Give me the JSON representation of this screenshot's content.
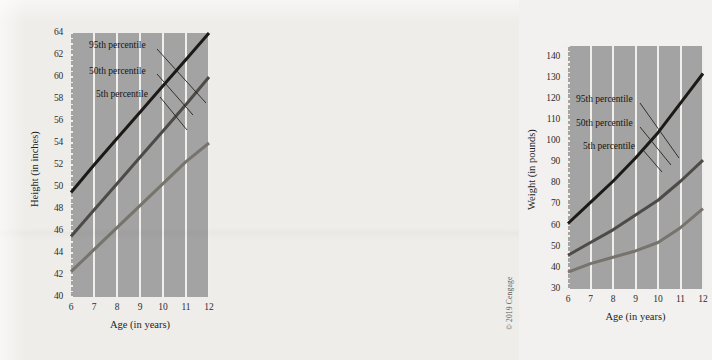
{
  "page": {
    "background_color": "#eeedea",
    "copyright": "© 2019 Cengage"
  },
  "series_style": {
    "p95_color": "#1c1a17",
    "p50_color": "#4d4b47",
    "p5_color": "#77746e",
    "plot_background": "#a3a3a3",
    "gridline_color": "#f0efec"
  },
  "legend": {
    "p95": "95th percentile",
    "p50": "50th percentile",
    "p5": "5th percentile"
  },
  "chart_data": [
    {
      "id": "height-chart",
      "type": "line",
      "title": "",
      "xlabel": "Age (in years)",
      "ylabel": "Height (in inches)",
      "xlim": [
        6,
        12
      ],
      "ylim": [
        40,
        64
      ],
      "xticks": [
        6,
        7,
        8,
        9,
        10,
        11,
        12
      ],
      "yticks": [
        40,
        42,
        44,
        46,
        48,
        50,
        52,
        54,
        56,
        58,
        60,
        62,
        64
      ],
      "ytick_minor_step": 0.5,
      "grid": "vertical",
      "legend_position": "inside-top-left",
      "x": [
        6,
        7,
        8,
        9,
        10,
        11,
        12
      ],
      "series": [
        {
          "name": "95th percentile",
          "values": [
            49.5,
            52.0,
            54.4,
            56.8,
            59.2,
            61.6,
            64.0
          ]
        },
        {
          "name": "50th percentile",
          "values": [
            45.5,
            47.9,
            50.3,
            52.7,
            55.1,
            57.5,
            60.0
          ]
        },
        {
          "name": "5th percentile",
          "values": [
            42.3,
            44.3,
            46.3,
            48.3,
            50.3,
            52.3,
            54.0
          ]
        }
      ]
    },
    {
      "id": "weight-chart",
      "type": "line",
      "title": "",
      "xlabel": "Age (in years)",
      "ylabel": "Weight (in pounds)",
      "xlim": [
        6,
        12
      ],
      "ylim": [
        30,
        145
      ],
      "xticks": [
        6,
        7,
        8,
        9,
        10,
        11,
        12
      ],
      "yticks": [
        30,
        40,
        50,
        60,
        70,
        80,
        90,
        100,
        110,
        120,
        130,
        140
      ],
      "ytick_minor_step": 2.5,
      "grid": "vertical",
      "legend_position": "inside-top-left",
      "x": [
        6,
        7,
        8,
        9,
        10,
        11,
        12
      ],
      "series": [
        {
          "name": "95th percentile",
          "values": [
            61,
            71,
            81,
            92,
            104,
            118,
            132
          ]
        },
        {
          "name": "50th percentile",
          "values": [
            46,
            52,
            58,
            65,
            72,
            81,
            91
          ]
        },
        {
          "name": "5th percentile",
          "values": [
            38,
            42,
            45,
            48,
            52,
            59,
            68
          ]
        }
      ]
    }
  ]
}
